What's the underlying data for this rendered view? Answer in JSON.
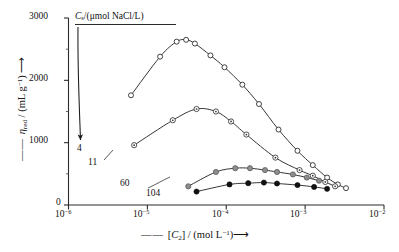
{
  "chart_data": {
    "type": "line",
    "title": "",
    "legend_title": "Cs/(μmol NaCl/L)",
    "legend_title_symbol": "C",
    "legend_title_sub": "s",
    "legend_title_rest": "/(μmol NaCl/L)",
    "xlabel": "[C2] / (mol L-1)",
    "xlabel_prefix": "[",
    "xlabel_sym": "C",
    "xlabel_sub": "2",
    "xlabel_mid": "] / (mol L",
    "xlabel_sup": "−1",
    "xlabel_end": ")",
    "ylabel": "ηred / (mL g-1)",
    "ylabel_sym": "η",
    "ylabel_sub": "red",
    "ylabel_mid": " / (mL g",
    "ylabel_sup": "−1",
    "ylabel_end": ")",
    "xscale": "log",
    "yscale": "linear",
    "xlim": [
      1e-06,
      0.01
    ],
    "ylim": [
      0,
      3000
    ],
    "xticks": [
      "10-6",
      "10-5",
      "10-4",
      "10-3",
      "10-2"
    ],
    "xtick_exponents": [
      "−6",
      "−5",
      "−4",
      "−3",
      "−2"
    ],
    "xtick_base": "10",
    "yticks": [
      0,
      1000,
      2000,
      3000
    ],
    "ytick_labels": [
      "0",
      "1000",
      "2000",
      "3000"
    ],
    "yminor": [
      500,
      1500,
      2500
    ],
    "grid": false,
    "legend_position": "inline-annotations",
    "series": [
      {
        "name": "4",
        "label": "4",
        "marker": "open-circle",
        "marker_fill": "#ffffff",
        "marker_stroke": "#222222",
        "points": [
          {
            "x": 6.2e-06,
            "y": 1760
          },
          {
            "x": 1.45e-05,
            "y": 2380
          },
          {
            "x": 2.35e-05,
            "y": 2620
          },
          {
            "x": 3.1e-05,
            "y": 2650
          },
          {
            "x": 4e-05,
            "y": 2590
          },
          {
            "x": 6.3e-05,
            "y": 2400
          },
          {
            "x": 9.5e-05,
            "y": 2210
          },
          {
            "x": 0.00016,
            "y": 1930
          },
          {
            "x": 0.00026,
            "y": 1620
          },
          {
            "x": 0.00046,
            "y": 1210
          },
          {
            "x": 0.0008,
            "y": 870
          },
          {
            "x": 0.00125,
            "y": 640
          },
          {
            "x": 0.0019,
            "y": 440
          },
          {
            "x": 0.0026,
            "y": 330
          },
          {
            "x": 0.0033,
            "y": 270
          }
        ]
      },
      {
        "name": "11",
        "label": "11",
        "marker": "dotted-circle",
        "marker_fill": "#ffffff",
        "marker_stroke": "#333333",
        "points": [
          {
            "x": 6.8e-06,
            "y": 960
          },
          {
            "x": 2.1e-05,
            "y": 1360
          },
          {
            "x": 4.2e-05,
            "y": 1540
          },
          {
            "x": 7.4e-05,
            "y": 1500
          },
          {
            "x": 0.000115,
            "y": 1340
          },
          {
            "x": 0.00018,
            "y": 1130
          },
          {
            "x": 0.00042,
            "y": 760
          },
          {
            "x": 0.00085,
            "y": 560
          },
          {
            "x": 0.00125,
            "y": 470
          },
          {
            "x": 0.0018,
            "y": 370
          },
          {
            "x": 0.0024,
            "y": 300
          }
        ]
      },
      {
        "name": "60",
        "label": "60",
        "marker": "gray-filled-circle",
        "marker_fill": "#8d8d8d",
        "marker_stroke": "#555555",
        "points": [
          {
            "x": 3.3e-05,
            "y": 300
          },
          {
            "x": 7.4e-05,
            "y": 530
          },
          {
            "x": 0.00013,
            "y": 590
          },
          {
            "x": 0.0002,
            "y": 590
          },
          {
            "x": 0.00031,
            "y": 560
          },
          {
            "x": 0.00044,
            "y": 530
          },
          {
            "x": 0.0007,
            "y": 490
          },
          {
            "x": 0.00105,
            "y": 440
          },
          {
            "x": 0.0015,
            "y": 390
          }
        ]
      },
      {
        "name": "104",
        "label": "104",
        "marker": "black-filled-circle",
        "marker_fill": "#111111",
        "marker_stroke": "#111111",
        "points": [
          {
            "x": 4.2e-05,
            "y": 215
          },
          {
            "x": 0.00011,
            "y": 330
          },
          {
            "x": 0.00019,
            "y": 350
          },
          {
            "x": 0.0003,
            "y": 360
          },
          {
            "x": 0.00044,
            "y": 345
          },
          {
            "x": 0.0008,
            "y": 320
          },
          {
            "x": 0.0013,
            "y": 290
          },
          {
            "x": 0.0019,
            "y": 260
          }
        ]
      }
    ],
    "annotations": [
      {
        "name": "legend-arrow",
        "text": "",
        "note": "curved arrow from legend rule down to series label 4"
      }
    ]
  }
}
